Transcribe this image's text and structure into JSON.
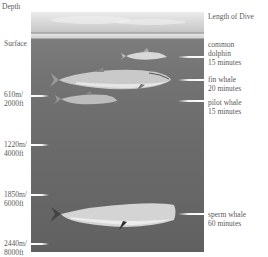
{
  "headers": {
    "depth": "Depth",
    "length": "Length of Dive"
  },
  "depth_labels": [
    {
      "id": "surface",
      "line1": "Surface",
      "line2": ""
    },
    {
      "id": "d610",
      "line1": "610m/",
      "line2": "2000ft"
    },
    {
      "id": "d1220",
      "line1": "1220m/",
      "line2": "4000ft"
    },
    {
      "id": "d1850",
      "line1": "1850m/",
      "line2": "6000ft"
    },
    {
      "id": "d2440",
      "line1": "2440m/",
      "line2": "8000ft"
    }
  ],
  "species": [
    {
      "name_line1": "common",
      "name_line2": "dolphin",
      "duration": "15 minutes"
    },
    {
      "name_line1": "fin whale",
      "name_line2": "",
      "duration": "20 minutes"
    },
    {
      "name_line1": "pilot whale",
      "name_line2": "",
      "duration": "15 minutes"
    },
    {
      "name_line1": "sperm whale",
      "name_line2": "",
      "duration": "60 minutes"
    }
  ],
  "colors": {
    "water": "#6e6e6e",
    "sky": "#e0e0e0",
    "text": "#5a5a5a"
  }
}
